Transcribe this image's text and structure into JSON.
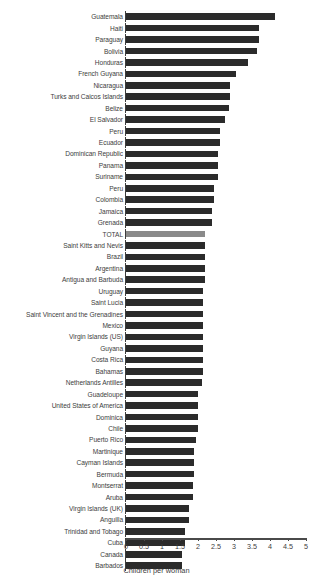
{
  "chart_data": {
    "type": "bar",
    "orientation": "horizontal",
    "title": "",
    "xlabel": "Children per woman",
    "ylabel": "",
    "xlim": [
      0,
      5
    ],
    "xticks": [
      "0",
      "0.5",
      "1",
      "1.5",
      "2",
      "2.5",
      "3",
      "3.5",
      "4",
      "4.5",
      "5"
    ],
    "xtick_values": [
      0,
      0.5,
      1,
      1.5,
      2,
      2.5,
      3,
      3.5,
      4,
      4.5,
      5
    ],
    "grid": false,
    "legend": "none",
    "bar_color": "#2b2b2b",
    "highlight_color": "#8a8a8a",
    "highlight_category": "TOTAL",
    "categories": [
      "Guatemala",
      "Haiti",
      "Paraguay",
      "Bolivia",
      "Honduras",
      "French Guyana",
      "Nicaragua",
      "Turks and Caicos Islands",
      "Belize",
      "El Salvador",
      "Peru",
      "Ecuador",
      "Dominican Republic",
      "Panama",
      "Suriname",
      "Peru",
      "Colombia",
      "Jamaica",
      "Grenada",
      "TOTAL",
      "Saint Kitts and Nevis",
      "Brazil",
      "Argentina",
      "Antigua and Barbuda",
      "Uruguay",
      "Saint Lucia",
      "Saint Vincent and the Grenadines",
      "Mexico",
      "Virgin Islands (US)",
      "Guyana",
      "Costa Rica",
      "Bahamas",
      "Netherlands Antilles",
      "Guadeloupe",
      "United States of America",
      "Dominica",
      "Chile",
      "Puerto Rico",
      "Martinique",
      "Cayman Islands",
      "Bermuda",
      "Montserrat",
      "Aruba",
      "Virgin Islands (UK)",
      "Anguilla",
      "Trinidad and Tobago",
      "Cuba",
      "Canada",
      "Barbados"
    ],
    "values": [
      4.15,
      3.7,
      3.7,
      3.65,
      3.4,
      3.05,
      2.9,
      2.9,
      2.85,
      2.75,
      2.6,
      2.6,
      2.55,
      2.55,
      2.55,
      2.45,
      2.45,
      2.4,
      2.4,
      2.2,
      2.2,
      2.2,
      2.2,
      2.2,
      2.15,
      2.15,
      2.15,
      2.15,
      2.15,
      2.15,
      2.15,
      2.15,
      2.1,
      2.0,
      2.0,
      2.0,
      2.0,
      1.95,
      1.9,
      1.9,
      1.9,
      1.85,
      1.85,
      1.75,
      1.75,
      1.65,
      1.65,
      1.55,
      1.55
    ]
  }
}
